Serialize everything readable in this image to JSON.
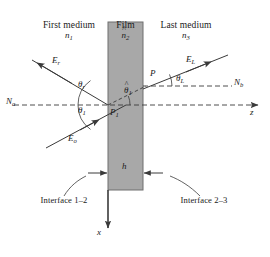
{
  "figure": {
    "background_color": "#ffffff",
    "film_fill_color": "#a8a8a8",
    "line_color": "#3a3a3a",
    "text_color": "#1a1a1a"
  },
  "media": {
    "first": {
      "name": "First medium",
      "index": "n",
      "index_sub": "1"
    },
    "film": {
      "name": "Film",
      "index": "n",
      "index_sub": "2",
      "index_hat": "^"
    },
    "last": {
      "name": "Last medium",
      "index": "n",
      "index_sub": "3"
    }
  },
  "fields": {
    "reflected": {
      "symbol": "E",
      "sub": "r"
    },
    "incident": {
      "symbol": "E",
      "sub": "o"
    },
    "transmitted": {
      "symbol": "E",
      "sub": "L"
    }
  },
  "angles": {
    "reflected": {
      "symbol": "θ",
      "sub": "r"
    },
    "incident": {
      "symbol": "θ",
      "sub": "1"
    },
    "film": {
      "symbol": "θ",
      "sub": "1",
      "hat": "^"
    },
    "transmitted": {
      "symbol": "θ",
      "sub": "L"
    }
  },
  "points": {
    "entry": {
      "label": "P",
      "sub": "1"
    },
    "exit": {
      "label": "P",
      "sub": ""
    }
  },
  "normals": {
    "left": {
      "label": "N",
      "sub": "a"
    },
    "right": {
      "label": "N",
      "sub": "b"
    }
  },
  "axes": {
    "horizontal": {
      "label": "z"
    },
    "vertical": {
      "label": "x"
    }
  },
  "thickness": {
    "label": "h"
  },
  "interfaces": {
    "left": {
      "line1": "Interface",
      "line2": "1–2"
    },
    "right": {
      "line1": "Interface",
      "line2": "2–3"
    }
  }
}
